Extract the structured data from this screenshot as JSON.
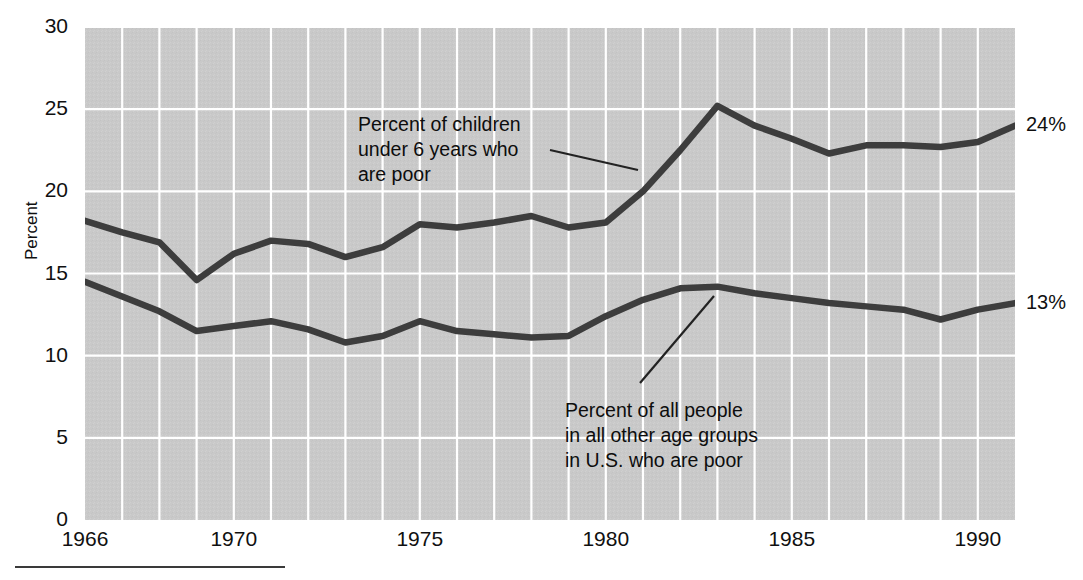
{
  "chart_data": {
    "type": "line",
    "title": "",
    "xlabel": "",
    "ylabel": "Percent",
    "xlim": [
      1966,
      1991
    ],
    "ylim": [
      0,
      30
    ],
    "yticks": [
      0,
      5,
      10,
      15,
      20,
      25,
      30
    ],
    "xticks": [
      1966,
      1970,
      1975,
      1980,
      1985,
      1990
    ],
    "grid": true,
    "legend_position": "inline-annotations",
    "plot_background": "#c8c8c8",
    "gridline_color": "#ffffff",
    "line_color": "#3a3a3a",
    "x": [
      1966,
      1967,
      1968,
      1969,
      1970,
      1971,
      1972,
      1973,
      1974,
      1975,
      1976,
      1977,
      1978,
      1979,
      1980,
      1981,
      1982,
      1983,
      1984,
      1985,
      1986,
      1987,
      1988,
      1989,
      1990,
      1991
    ],
    "series": [
      {
        "name": "Percent of children under 6 years who are poor",
        "end_label": "24%",
        "values": [
          18.2,
          17.5,
          16.9,
          14.6,
          16.2,
          17.0,
          16.8,
          16.0,
          16.6,
          18.0,
          17.8,
          18.1,
          18.5,
          17.8,
          18.1,
          20.0,
          22.5,
          25.2,
          24.0,
          23.2,
          22.3,
          22.8,
          22.8,
          22.7,
          23.0,
          24.0
        ]
      },
      {
        "name": "Percent of all people in all other age groups in U.S. who are poor",
        "end_label": "13%",
        "values": [
          14.5,
          13.6,
          12.7,
          11.5,
          11.8,
          12.1,
          11.6,
          10.8,
          11.2,
          12.1,
          11.5,
          11.3,
          11.1,
          11.2,
          12.4,
          13.4,
          14.1,
          14.2,
          13.8,
          13.5,
          13.2,
          13.0,
          12.8,
          12.2,
          12.8,
          13.2
        ]
      }
    ],
    "annotations": [
      {
        "id": "upper-annotation",
        "lines": [
          "Percent of children",
          "under 6 years who",
          "are poor"
        ],
        "text_x": 358,
        "text_y": 112,
        "leader": {
          "x1": 550,
          "y1": 150,
          "x2": 638,
          "y2": 170
        }
      },
      {
        "id": "lower-annotation",
        "lines": [
          "Percent of all people",
          "in all other age groups",
          "in U.S. who are poor"
        ],
        "text_x": 565,
        "text_y": 398,
        "leader": {
          "x1": 714,
          "y1": 296,
          "x2": 640,
          "y2": 383
        }
      }
    ]
  },
  "axes": {
    "ytick_labels": [
      "30",
      "25",
      "20",
      "15",
      "10",
      "5",
      "0"
    ],
    "xtick_labels": [
      "1966",
      "1970",
      "1975",
      "1980",
      "1985",
      "1990"
    ],
    "ylabel": "Percent"
  },
  "end_labels": {
    "upper": "24%",
    "lower": "13%"
  }
}
